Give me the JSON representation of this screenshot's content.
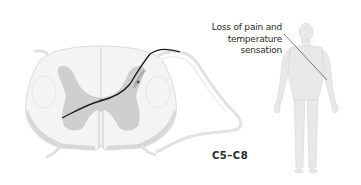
{
  "diagram": {
    "callout": {
      "line1": "Loss of pain and",
      "line2": "temperature",
      "line3": "sensation"
    },
    "segment_label": "C5–C8",
    "colors": {
      "white_matter": "#f4f4f4",
      "white_matter_edge": "#d4d4d4",
      "gray_matter": "#cfcfcf",
      "pathway": "#1a1a1a",
      "body": "#e6e6e6",
      "body_edge": "#d0d0d0",
      "text": "#2a2a2a"
    }
  }
}
